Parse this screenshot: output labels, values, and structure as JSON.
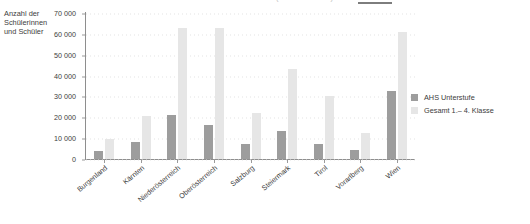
{
  "title": {
    "text": "Anzahl der Schülerinnen und Schüler (AHS Unterstufe)",
    "cut_off": true
  },
  "y_axis_caption": "Anzahl der Schülerinnen und Schüler",
  "legend": {
    "position": "right",
    "items": [
      {
        "label": "AHS Unterstufe",
        "color": "#9d9d9d"
      },
      {
        "label": "Gesamt 1.– 4. Klasse",
        "color": "#e6e6e6"
      }
    ]
  },
  "chart_data": {
    "type": "bar",
    "title": "Anzahl der Schülerinnen und Schüler (AHS Unterstufe)",
    "xlabel": "",
    "ylabel": "Anzahl der Schülerinnen und Schüler",
    "ylim": [
      0,
      70000
    ],
    "ytick_values": [
      0,
      10000,
      20000,
      30000,
      40000,
      50000,
      60000,
      70000
    ],
    "ytick_labels": [
      "0",
      "10 000",
      "20 000",
      "30 000",
      "40 000",
      "50 000",
      "60 000",
      "70 000"
    ],
    "grid": true,
    "legend_position": "right",
    "categories": [
      "Burgenland",
      "Kärnten",
      "Niederösterreich",
      "Oberösterreich",
      "Salzburg",
      "Steiermark",
      "Tirol",
      "Vorarlberg",
      "Wien"
    ],
    "series": [
      {
        "name": "AHS Unterstufe",
        "color": "#9d9d9d",
        "values": [
          4000,
          8000,
          21000,
          16500,
          7000,
          13500,
          7000,
          4500,
          32500
        ]
      },
      {
        "name": "Gesamt 1.– 4. Klasse",
        "color": "#e6e6e6",
        "values": [
          9500,
          20500,
          63000,
          63000,
          22000,
          43000,
          30000,
          12500,
          61000
        ]
      }
    ]
  }
}
